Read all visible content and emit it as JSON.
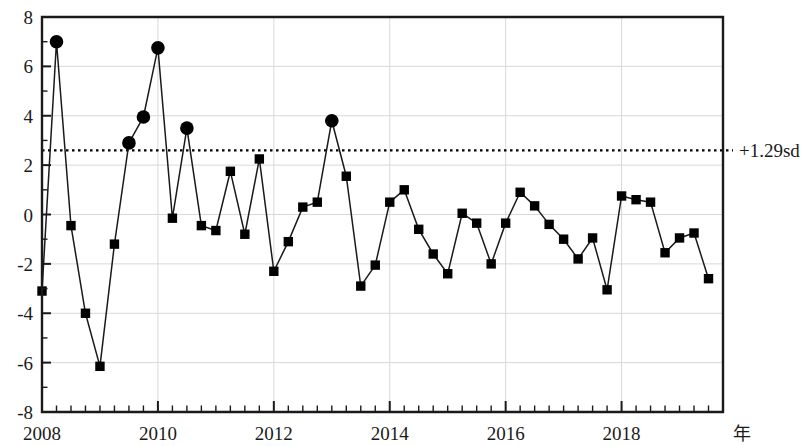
{
  "chart_data": {
    "type": "line",
    "title": "",
    "subtitle": "",
    "xlabel": "年",
    "ylabel": "",
    "xlim": [
      2008.0,
      2019.75
    ],
    "ylim": [
      -8,
      8
    ],
    "grid": true,
    "legend": null,
    "y_ticks_major": [
      8,
      6,
      4,
      2,
      0,
      -2,
      -4,
      -6,
      -8
    ],
    "y_tick_labels": [
      "8",
      "6",
      "4",
      "2",
      "0",
      "-2",
      "-4",
      "-6",
      "-8"
    ],
    "y_minor_step": 1,
    "x_ticks_major": [
      2008,
      2010,
      2012,
      2014,
      2016,
      2018
    ],
    "x_tick_labels": [
      "2008",
      "2010",
      "2012",
      "2014",
      "2016",
      "2018"
    ],
    "x_minor_step": 0.25,
    "annotations": [
      {
        "name": "threshold-line",
        "label": "+1.29sd",
        "value": 2.6,
        "style": "dotted-horizontal"
      }
    ],
    "marker_styles": {
      "square": "normal-quarter",
      "circle": "above-threshold-quarter"
    },
    "series": [
      {
        "name": "quarterly-index",
        "x": [
          2008.0,
          2008.25,
          2008.5,
          2008.75,
          2009.0,
          2009.25,
          2009.5,
          2009.75,
          2010.0,
          2010.25,
          2010.5,
          2010.75,
          2011.0,
          2011.25,
          2011.5,
          2011.75,
          2012.0,
          2012.25,
          2012.5,
          2012.75,
          2013.0,
          2013.25,
          2013.5,
          2013.75,
          2014.0,
          2014.25,
          2014.5,
          2014.75,
          2015.0,
          2015.25,
          2015.5,
          2015.75,
          2016.0,
          2016.25,
          2016.5,
          2016.75,
          2017.0,
          2017.25,
          2017.5,
          2017.75,
          2018.0,
          2018.25,
          2018.5,
          2018.75,
          2019.0,
          2019.25,
          2019.5
        ],
        "values": [
          -3.1,
          7.0,
          -0.45,
          -4.0,
          -6.15,
          -1.2,
          2.9,
          3.95,
          6.75,
          -0.15,
          3.5,
          -0.45,
          -0.65,
          1.75,
          -0.8,
          2.25,
          -2.3,
          -1.1,
          0.3,
          0.5,
          3.8,
          1.55,
          -2.9,
          -2.05,
          0.5,
          1.0,
          -0.6,
          -1.6,
          -2.4,
          0.05,
          -0.35,
          -2.0,
          -0.35,
          0.9,
          0.35,
          -0.4,
          -1.0,
          -1.8,
          -0.95,
          -3.05,
          0.75,
          0.6,
          0.5,
          -1.55,
          -0.95,
          -0.75,
          -2.6
        ],
        "markers": [
          "square",
          "circle",
          "square",
          "square",
          "square",
          "square",
          "circle",
          "circle",
          "circle",
          "square",
          "circle",
          "square",
          "square",
          "square",
          "square",
          "square",
          "square",
          "square",
          "square",
          "square",
          "circle",
          "square",
          "square",
          "square",
          "square",
          "square",
          "square",
          "square",
          "square",
          "square",
          "square",
          "square",
          "square",
          "square",
          "square",
          "square",
          "square",
          "square",
          "square",
          "square",
          "square",
          "square",
          "square",
          "square",
          "square",
          "square",
          "square"
        ]
      }
    ],
    "colors": {
      "line": "#1a1a1a",
      "marker": "#000000",
      "grid": "#d8d8d8",
      "axis": "#1a1a1a",
      "threshold": "#000000",
      "background": "#ffffff"
    }
  }
}
